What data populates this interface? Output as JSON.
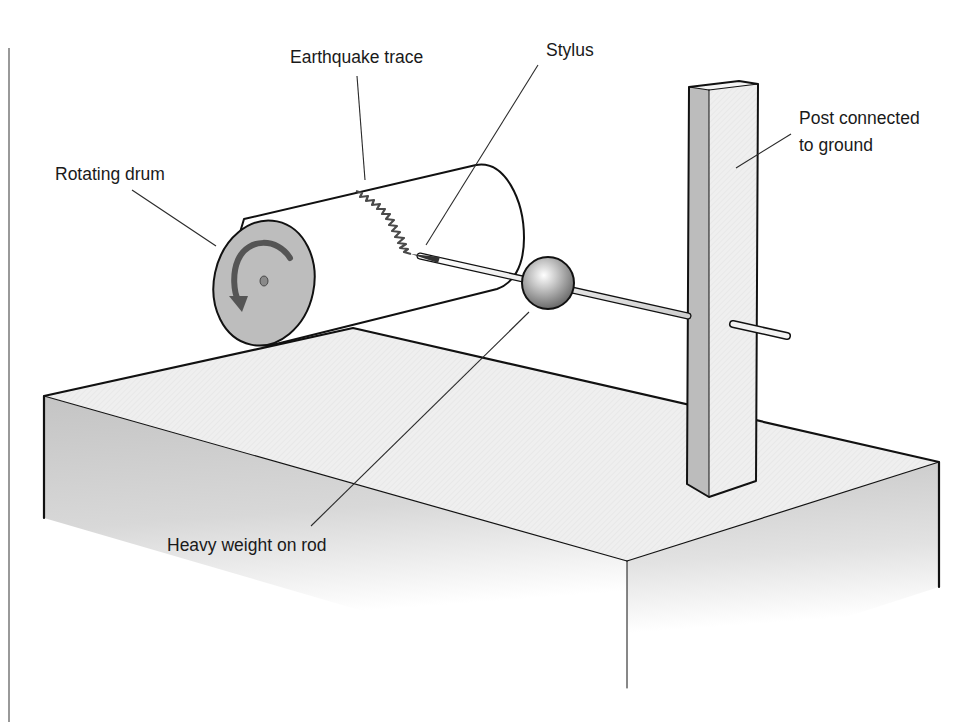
{
  "diagram": {
    "labels": {
      "earthquake_trace": "Earthquake trace",
      "stylus": "Stylus",
      "rotating_drum": "Rotating drum",
      "post_line1": "Post connected",
      "post_line2": "to ground",
      "heavy_weight": "Heavy weight on rod"
    },
    "components": [
      "rotating-drum",
      "earthquake-trace",
      "stylus",
      "weight-ball",
      "rod",
      "post",
      "ground-block"
    ],
    "colors": {
      "outline": "#111111",
      "drum_face": "#bdbdbd",
      "arrow": "#555555",
      "trace": "#4a4a4a",
      "block_top": "#ececec",
      "block_side": "#b8b8b8",
      "post_side": "#bcbcbc",
      "post_front": "#efefef"
    }
  }
}
